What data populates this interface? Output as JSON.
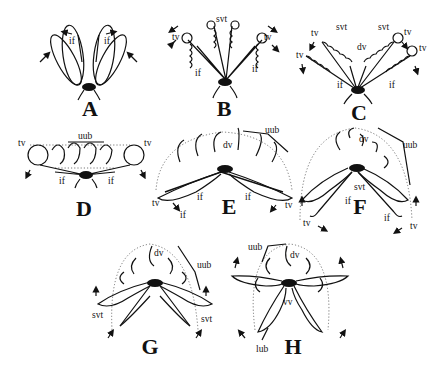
{
  "figure": {
    "panels": [
      {
        "letter": "A",
        "labels": [
          "if",
          "if"
        ]
      },
      {
        "letter": "B",
        "labels": [
          "svt",
          "tv",
          "tv",
          "if",
          "if"
        ]
      },
      {
        "letter": "C",
        "labels": [
          "svt",
          "svt",
          "dv",
          "tv",
          "tv",
          "tv",
          "tv",
          "if",
          "if"
        ]
      },
      {
        "letter": "D",
        "labels": [
          "uub",
          "tv",
          "tv",
          "if",
          "if"
        ]
      },
      {
        "letter": "E",
        "labels": [
          "uub",
          "dv",
          "if",
          "if",
          "if",
          "tv",
          "tv"
        ]
      },
      {
        "letter": "F",
        "labels": [
          "dv",
          "uub",
          "svt",
          "if",
          "if",
          "tv",
          "tv"
        ]
      },
      {
        "letter": "G",
        "labels": [
          "dv",
          "uub",
          "svt",
          "svt"
        ]
      },
      {
        "letter": "H",
        "labels": [
          "uub",
          "dv",
          "vv",
          "lub"
        ]
      }
    ]
  },
  "panels": {
    "A": {
      "letter": "A",
      "if_left": "if",
      "if_right": "if"
    },
    "B": {
      "letter": "B",
      "svt": "svt",
      "tv_left": "tv",
      "tv_right": "tv",
      "if_left": "if",
      "if_right": "if"
    },
    "C": {
      "letter": "C",
      "svt_left": "svt",
      "svt_right": "svt",
      "dv": "dv",
      "tv_1": "tv",
      "tv_2": "tv",
      "tv_3": "tv",
      "tv_4": "tv",
      "if_left": "if",
      "if_right": "if"
    },
    "D": {
      "letter": "D",
      "uub": "uub",
      "tv_left": "tv",
      "tv_right": "tv",
      "if_left": "if",
      "if_right": "if"
    },
    "E": {
      "letter": "E",
      "uub": "uub",
      "dv": "dv",
      "if_left": "if",
      "if_right": "if",
      "if_bottom": "if",
      "tv_left": "tv",
      "tv_right": "tv"
    },
    "F": {
      "letter": "F",
      "dv": "dv",
      "uub": "uub",
      "svt": "svt",
      "if_left": "if",
      "if_right": "if",
      "tv_left": "tv",
      "tv_right": "tv"
    },
    "G": {
      "letter": "G",
      "dv": "dv",
      "uub": "uub",
      "svt_left": "svt",
      "svt_right": "svt"
    },
    "H": {
      "letter": "H",
      "uub": "uub",
      "dv": "dv",
      "vv": "vv",
      "lub": "lub"
    }
  }
}
